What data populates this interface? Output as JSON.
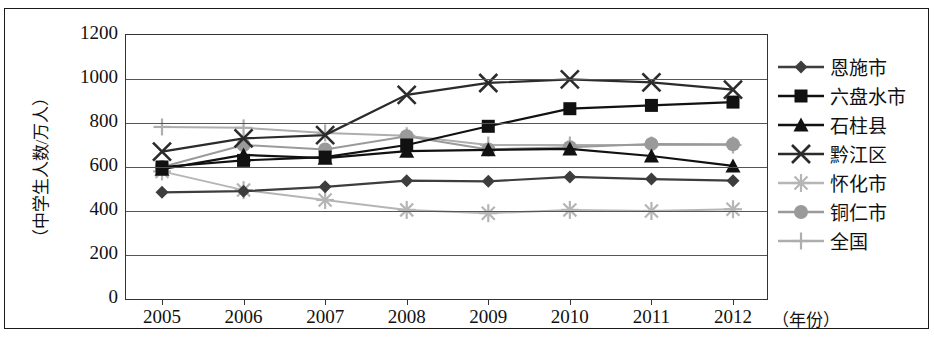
{
  "axes": {
    "y_label": "（中学生人数/万人）",
    "x_label": "（年份）",
    "y_ticks": [
      "1200",
      "1000",
      "800",
      "600",
      "400",
      "200",
      "0"
    ],
    "x_ticks": [
      "2005",
      "2006",
      "2007",
      "2008",
      "2009",
      "2010",
      "2011",
      "2012"
    ]
  },
  "legend": {
    "items": [
      {
        "label": "恩施市",
        "marker": "diamond-marker",
        "color": "#3d3d3d"
      },
      {
        "label": "六盘水市",
        "marker": "square-marker",
        "color": "#111111"
      },
      {
        "label": "石柱县",
        "marker": "triangle-marker",
        "color": "#111111"
      },
      {
        "label": "黔江区",
        "marker": "x-marker",
        "color": "#2b2b2b"
      },
      {
        "label": "怀化市",
        "marker": "asterisk-marker",
        "color": "#b5b5b5"
      },
      {
        "label": "铜仁市",
        "marker": "circle-marker",
        "color": "#9a9a9a"
      },
      {
        "label": "全国",
        "marker": "plus-marker",
        "color": "#aeaeae"
      }
    ]
  },
  "chart_data": {
    "type": "line",
    "title": "",
    "xlabel": "（年份）",
    "ylabel": "（中学生人数/万人）",
    "categories": [
      "2005",
      "2006",
      "2007",
      "2008",
      "2009",
      "2010",
      "2011",
      "2012"
    ],
    "ylim": [
      0,
      1200
    ],
    "ytick_step": 200,
    "grid": true,
    "legend_position": "right",
    "series": [
      {
        "name": "恩施市",
        "marker": "diamond",
        "color": "#3d3d3d",
        "values": [
          485,
          490,
          510,
          538,
          535,
          555,
          545,
          538
        ]
      },
      {
        "name": "六盘水市",
        "marker": "square",
        "color": "#111111",
        "values": [
          600,
          630,
          645,
          700,
          785,
          865,
          880,
          895
        ]
      },
      {
        "name": "石柱县",
        "marker": "triangle",
        "color": "#111111",
        "values": [
          590,
          655,
          640,
          672,
          678,
          682,
          650,
          605
        ]
      },
      {
        "name": "黔江区",
        "marker": "x",
        "color": "#2b2b2b",
        "values": [
          670,
          730,
          745,
          928,
          982,
          998,
          985,
          952
        ]
      },
      {
        "name": "怀化市",
        "marker": "asterisk",
        "color": "#b5b5b5",
        "values": [
          580,
          495,
          450,
          405,
          390,
          405,
          400,
          408
        ]
      },
      {
        "name": "铜仁市",
        "marker": "circle",
        "color": "#9a9a9a",
        "values": [
          600,
          700,
          680,
          740,
          680,
          690,
          705,
          703
        ]
      },
      {
        "name": "全国",
        "marker": "plus",
        "color": "#aeaeae",
        "values": [
          782,
          778,
          755,
          742,
          700,
          700,
          700,
          700
        ]
      }
    ]
  }
}
